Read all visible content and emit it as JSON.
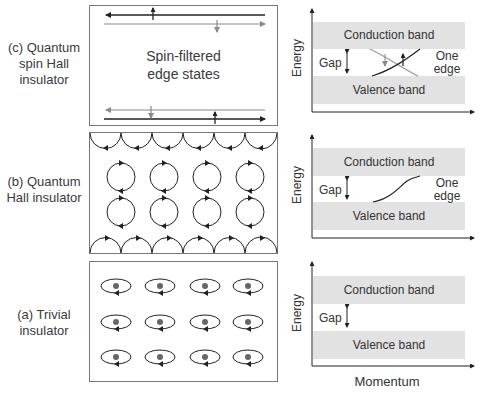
{
  "panels": [
    {
      "id": "c",
      "label_lines": [
        "(c) Quantum",
        "spin Hall",
        "insulator"
      ],
      "center_text_lines": [
        "Spin-filtered",
        "edge states"
      ],
      "plot": {
        "y_label": "Energy",
        "conduction": "Conduction band",
        "valence": "Valence band",
        "gap": "Gap",
        "edge_lines": [
          "One",
          "edge"
        ]
      }
    },
    {
      "id": "b",
      "label_lines": [
        "(b) Quantum",
        "Hall insulator"
      ],
      "plot": {
        "y_label": "Energy",
        "conduction": "Conduction band",
        "valence": "Valence band",
        "gap": "Gap",
        "edge_lines": [
          "One",
          "edge"
        ]
      }
    },
    {
      "id": "a",
      "label_lines": [
        "(a) Trivial",
        "insulator"
      ],
      "plot": {
        "y_label": "Energy",
        "conduction": "Conduction band",
        "valence": "Valence band",
        "gap": "Gap",
        "x_label": "Momentum"
      }
    }
  ],
  "colors": {
    "band_fill": "#e2e2e2",
    "line": "#333333",
    "gray_line": "#8a8a8a",
    "dot": "#666666"
  }
}
